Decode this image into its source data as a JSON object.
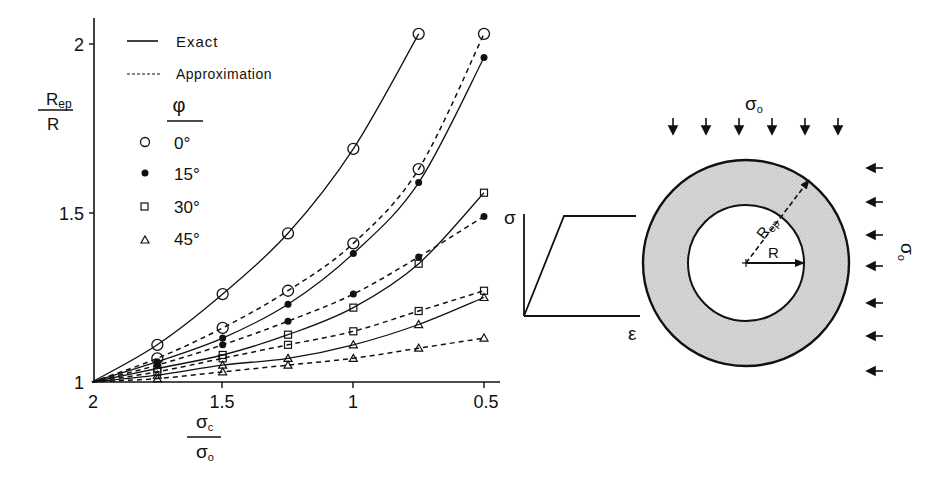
{
  "chart_data": {
    "type": "line",
    "title": "",
    "xlabel": "σc / σo",
    "ylabel": "Rep / R",
    "xlim": [
      2.0,
      0.45
    ],
    "ylim": [
      1.0,
      2.05
    ],
    "x_reversed": true,
    "grid": false,
    "x_ticks": [
      2,
      1.5,
      1,
      0.5
    ],
    "x_tick_labels": [
      "2",
      "1.5",
      "1",
      "0.5"
    ],
    "y_ticks": [
      1,
      1.5,
      2
    ],
    "y_tick_labels": [
      "1",
      "1.5",
      "2"
    ],
    "legend": {
      "position": "upper-left",
      "line_styles": [
        {
          "label": "Exact",
          "style": "solid"
        },
        {
          "label": "Approximation",
          "style": "dashed"
        }
      ],
      "marker_title": "φ",
      "markers": [
        {
          "label": "0°",
          "marker": "open-circle"
        },
        {
          "label": "15°",
          "marker": "filled-circle"
        },
        {
          "label": "30°",
          "marker": "open-square"
        },
        {
          "label": "45°",
          "marker": "open-triangle"
        }
      ]
    },
    "series": [
      {
        "name": "Exact φ=0°",
        "style": "solid",
        "marker": "open-circle",
        "x": [
          2.0,
          1.75,
          1.5,
          1.25,
          1.0,
          0.75
        ],
        "y": [
          1.0,
          1.11,
          1.26,
          1.44,
          1.69,
          2.03
        ]
      },
      {
        "name": "Approximation φ=0°",
        "style": "dashed",
        "marker": "open-circle",
        "x": [
          2.0,
          1.75,
          1.5,
          1.25,
          1.0,
          0.75,
          0.5
        ],
        "y": [
          1.0,
          1.07,
          1.16,
          1.27,
          1.41,
          1.63,
          2.03
        ]
      },
      {
        "name": "Exact φ=15°",
        "style": "solid",
        "marker": "filled-circle",
        "x": [
          2.0,
          1.75,
          1.5,
          1.25,
          1.0,
          0.75,
          0.5
        ],
        "y": [
          1.0,
          1.06,
          1.13,
          1.23,
          1.38,
          1.59,
          1.96
        ]
      },
      {
        "name": "Approximation φ=15°",
        "style": "dashed",
        "marker": "filled-circle",
        "x": [
          2.0,
          1.75,
          1.5,
          1.25,
          1.0,
          0.75,
          0.5
        ],
        "y": [
          1.0,
          1.05,
          1.11,
          1.18,
          1.26,
          1.37,
          1.49
        ]
      },
      {
        "name": "Exact φ=30°",
        "style": "solid",
        "marker": "open-square",
        "x": [
          2.0,
          1.75,
          1.5,
          1.25,
          1.0,
          0.75,
          0.5
        ],
        "y": [
          1.0,
          1.04,
          1.08,
          1.14,
          1.22,
          1.35,
          1.56
        ]
      },
      {
        "name": "Approximation φ=30°",
        "style": "dashed",
        "marker": "open-square",
        "x": [
          2.0,
          1.75,
          1.5,
          1.25,
          1.0,
          0.75,
          0.5
        ],
        "y": [
          1.0,
          1.03,
          1.07,
          1.11,
          1.15,
          1.21,
          1.27
        ]
      },
      {
        "name": "Exact φ=45°",
        "style": "solid",
        "marker": "open-triangle",
        "x": [
          2.0,
          1.75,
          1.5,
          1.25,
          1.0,
          0.75,
          0.5
        ],
        "y": [
          1.0,
          1.02,
          1.05,
          1.07,
          1.11,
          1.17,
          1.25
        ]
      },
      {
        "name": "Approximation φ=45°",
        "style": "dashed",
        "marker": "open-triangle",
        "x": [
          2.0,
          1.75,
          1.5,
          1.25,
          1.0,
          0.75,
          0.5
        ],
        "y": [
          1.0,
          1.01,
          1.03,
          1.05,
          1.07,
          1.1,
          1.13
        ]
      }
    ]
  },
  "labels": {
    "y_axis_num": "R",
    "y_axis_num_sub": "ep",
    "y_axis_den": "R",
    "x_axis_num": "σ",
    "x_axis_num_sub": "c",
    "x_axis_den": "σ",
    "x_axis_den_sub": "o",
    "legend_exact": "Exact",
    "legend_approx": "Approximation",
    "legend_phi": "φ",
    "legend_0": "0°",
    "legend_15": "15°",
    "legend_30": "30°",
    "legend_45": "45°",
    "tick_x_2": "2",
    "tick_x_15": "1.5",
    "tick_x_1": "1",
    "tick_x_05": "0.5",
    "tick_y_2": "2",
    "tick_y_15": "1.5",
    "tick_y_1": "1"
  },
  "stress_strain": {
    "y_label": "σ",
    "x_label": "ε"
  },
  "tunnel_diagram": {
    "top_stress_label": "σ",
    "top_stress_sub": "o",
    "side_stress_label": "σ",
    "side_stress_sub": "o",
    "outer_radius_label": "R",
    "outer_radius_sub": "ep",
    "inner_radius_label": "R",
    "plastic_zone_fill": "#cfcfcf"
  }
}
